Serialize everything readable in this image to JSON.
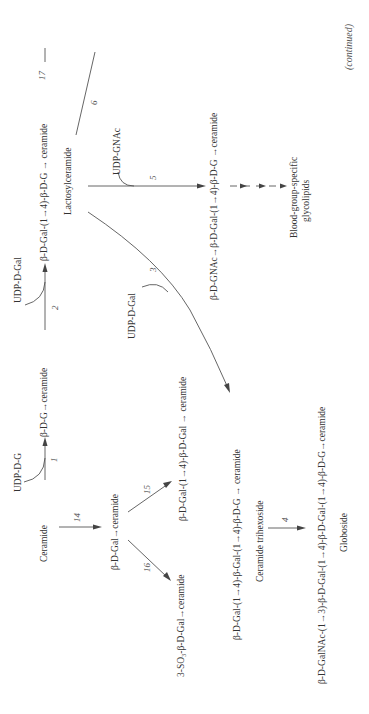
{
  "diagram": {
    "orientation": "rotated-90-ccw",
    "footer": "(continued)",
    "nodes": {
      "ceramide": "Ceramide",
      "udp_glucose": "UDP-D-G",
      "glucosylceramide": "β-D-G→ceramide",
      "udp_gal_top": "UDP-D-Gal",
      "lactosylceramide_formula": "β-D-Gal-(1→4)-β-D-G → ceramide",
      "lactosylceramide_name": "Lactosylceramide",
      "udp_gnac": "UDP-GNAc",
      "gnac_lactosyl": "β-D-GNAc→β-D-Gal-(1→4)-β-D-G →ceramide",
      "blood_group_1": "Blood-group-specific",
      "blood_group_2": "glycolipids",
      "udp_gal_mid": "UDP-D-Gal",
      "galactosylceramide": "β-D-Gal→ceramide",
      "digalactosylceramide": "β-D-Gal-(1→4)-β-D-Gal → ceramide",
      "sulfatide": "3-SO₃-β-D-Gal→ceramide",
      "ceramide_trihexoside_formula": "β-D-Gal-(1→4)-β-Gal-(1→4)-β-D-G → ceramide",
      "ceramide_trihexoside_name": "Ceramide trihexoside",
      "globoside_formula": "β-D-GalNAc-(1→3)-β-D-Gal-(1→4)-β-D-Gal-(1→4)-β-D-G→ceramide",
      "globoside_name": "Globoside"
    },
    "reaction_numbers": {
      "r1": "1",
      "r2": "2",
      "r3": "3",
      "r4": "4",
      "r5": "5",
      "r6": "6",
      "r14": "14",
      "r15": "15",
      "r16": "16",
      "r17": "17"
    }
  }
}
